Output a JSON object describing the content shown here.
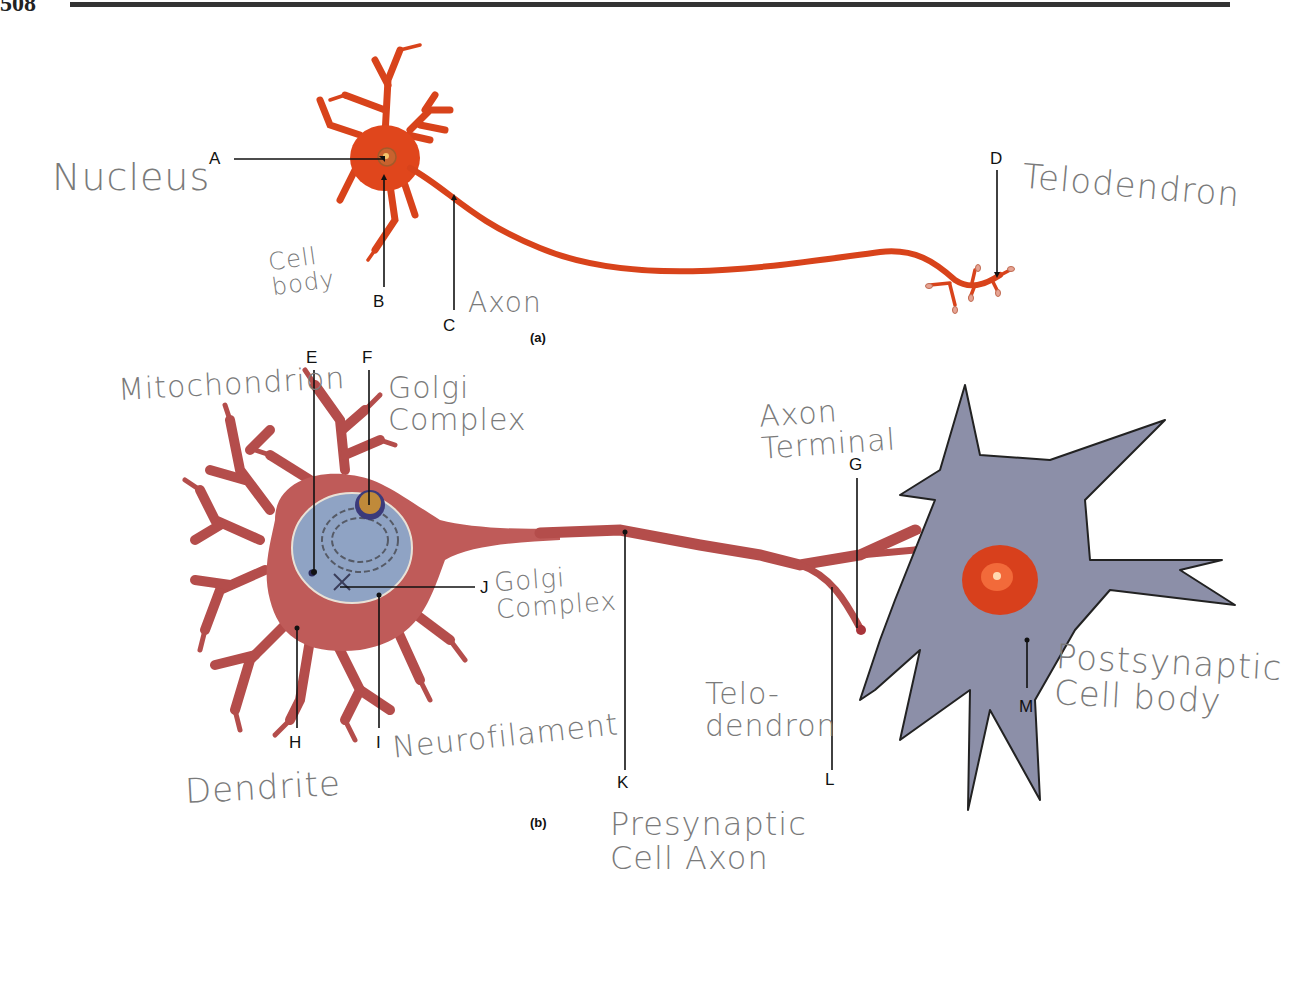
{
  "page": {
    "number": "508"
  },
  "figure": {
    "panels": [
      {
        "id": "a",
        "label": "(a)"
      },
      {
        "id": "b",
        "label": "(b)"
      }
    ],
    "letter_labels": {
      "A": "A",
      "B": "B",
      "C": "C",
      "D": "D",
      "E": "E",
      "F": "F",
      "G": "G",
      "H": "H",
      "I": "I",
      "J": "J",
      "K": "K",
      "L": "L",
      "M": "M"
    },
    "colors": {
      "neuron_a": "#e0461c",
      "neuron_b": "#b9514f",
      "nucleus_b": "#8fa3c4",
      "postsynaptic_cell": "#8c8fa8",
      "postsynaptic_nucleus": "#e8401c",
      "leader_line": "#111111",
      "handwriting": "#7a7a7a"
    }
  },
  "handwritten_answers": {
    "A": "Nucleus",
    "B": "Cell\nbody",
    "C": "Axon",
    "D": "Telodendron",
    "E": "Mitochondrion",
    "F": "Golgi\nComplex",
    "G": "Axon\nTerminal",
    "J": "Golgi\nComplex",
    "H": "Dendrite",
    "I": "Neurofilament",
    "K": "Presynaptic\nCell Axon",
    "L": "Telo-\ndendron",
    "M": "Postsynaptic\nCell body"
  }
}
